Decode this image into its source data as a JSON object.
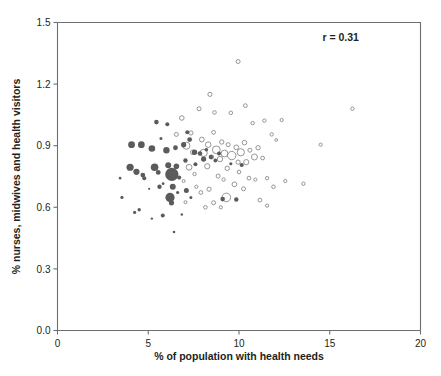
{
  "chart_data": {
    "type": "scatter",
    "title": "",
    "xlabel": "% of population with health needs",
    "ylabel": "% nurses, midwives and health visitors",
    "xlim": [
      0,
      20
    ],
    "ylim": [
      0.0,
      1.5
    ],
    "xticks": [
      "0",
      "5",
      "10",
      "15",
      "20"
    ],
    "xtick_values": [
      0,
      5,
      10,
      15,
      20
    ],
    "yticks": [
      "0.0",
      "0.3",
      "0.6",
      "0.9",
      "1.2",
      "1.5"
    ],
    "ytick_values": [
      0.0,
      0.3,
      0.6,
      0.9,
      1.2,
      1.5
    ],
    "grid": false,
    "legend": "none",
    "annotations": [
      {
        "name": "correlation",
        "text": "r = 0.31",
        "x": 15.6,
        "y": 1.41
      }
    ],
    "series": [
      {
        "name": "filled",
        "marker": "filled-circle",
        "color": "#5b5b5d",
        "points": [
          {
            "x": 3.55,
            "y": 0.648,
            "s": 1.6
          },
          {
            "x": 3.45,
            "y": 0.742,
            "s": 1.3
          },
          {
            "x": 4.25,
            "y": 0.575,
            "s": 1.6
          },
          {
            "x": 4.5,
            "y": 0.588,
            "s": 1.7
          },
          {
            "x": 4.08,
            "y": 0.905,
            "s": 3.4
          },
          {
            "x": 4.62,
            "y": 0.905,
            "s": 3.4
          },
          {
            "x": 4.0,
            "y": 0.795,
            "s": 3.6
          },
          {
            "x": 4.35,
            "y": 0.773,
            "s": 3.1
          },
          {
            "x": 4.7,
            "y": 0.757,
            "s": 2.4
          },
          {
            "x": 4.78,
            "y": 0.742,
            "s": 2.0
          },
          {
            "x": 5.2,
            "y": 0.886,
            "s": 3.3
          },
          {
            "x": 5.35,
            "y": 0.795,
            "s": 3.8
          },
          {
            "x": 5.55,
            "y": 0.77,
            "s": 2.4
          },
          {
            "x": 5.45,
            "y": 1.015,
            "s": 2.3
          },
          {
            "x": 5.7,
            "y": 0.935,
            "s": 1.5
          },
          {
            "x": 5.62,
            "y": 0.7,
            "s": 2.2
          },
          {
            "x": 5.82,
            "y": 0.715,
            "s": 1.4
          },
          {
            "x": 5.2,
            "y": 0.545,
            "s": 1.2
          },
          {
            "x": 5.8,
            "y": 0.56,
            "s": 2.0
          },
          {
            "x": 6.0,
            "y": 0.878,
            "s": 3.2
          },
          {
            "x": 6.1,
            "y": 0.805,
            "s": 3.0
          },
          {
            "x": 6.3,
            "y": 0.76,
            "s": 6.6
          },
          {
            "x": 6.35,
            "y": 0.7,
            "s": 3.0
          },
          {
            "x": 6.2,
            "y": 0.648,
            "s": 4.6
          },
          {
            "x": 6.28,
            "y": 0.622,
            "s": 2.6
          },
          {
            "x": 6.5,
            "y": 0.89,
            "s": 2.4
          },
          {
            "x": 6.55,
            "y": 0.8,
            "s": 2.8
          },
          {
            "x": 6.7,
            "y": 0.745,
            "s": 2.1
          },
          {
            "x": 6.62,
            "y": 0.672,
            "s": 1.6
          },
          {
            "x": 6.42,
            "y": 0.48,
            "s": 1.3
          },
          {
            "x": 6.95,
            "y": 0.905,
            "s": 2.6
          },
          {
            "x": 7.05,
            "y": 0.828,
            "s": 2.2
          },
          {
            "x": 7.15,
            "y": 0.965,
            "s": 2.0
          },
          {
            "x": 7.28,
            "y": 0.93,
            "s": 2.4
          },
          {
            "x": 7.1,
            "y": 0.682,
            "s": 2.5
          },
          {
            "x": 7.35,
            "y": 0.648,
            "s": 1.5
          },
          {
            "x": 7.55,
            "y": 0.868,
            "s": 2.7
          },
          {
            "x": 7.6,
            "y": 0.81,
            "s": 2.0
          },
          {
            "x": 7.85,
            "y": 0.862,
            "s": 2.3
          },
          {
            "x": 8.05,
            "y": 0.835,
            "s": 2.6
          },
          {
            "x": 8.2,
            "y": 0.88,
            "s": 1.8
          },
          {
            "x": 8.45,
            "y": 0.845,
            "s": 2.2
          },
          {
            "x": 8.7,
            "y": 0.828,
            "s": 1.9
          },
          {
            "x": 8.9,
            "y": 0.862,
            "s": 2.0
          },
          {
            "x": 9.1,
            "y": 0.64,
            "s": 2.3
          },
          {
            "x": 9.85,
            "y": 0.638,
            "s": 2.2
          },
          {
            "x": 9.55,
            "y": 0.812,
            "s": 1.6
          },
          {
            "x": 10.15,
            "y": 0.806,
            "s": 2.1
          },
          {
            "x": 6.85,
            "y": 0.565,
            "s": 1.2
          },
          {
            "x": 5.05,
            "y": 0.69,
            "s": 1.1
          },
          {
            "x": 6.05,
            "y": 1.005,
            "s": 2.0
          }
        ]
      },
      {
        "name": "open",
        "marker": "open-circle",
        "color": "#8a8a8d",
        "points": [
          {
            "x": 6.55,
            "y": 0.955,
            "s": 2.0
          },
          {
            "x": 6.85,
            "y": 1.035,
            "s": 2.3
          },
          {
            "x": 7.1,
            "y": 0.9,
            "s": 3.6
          },
          {
            "x": 7.35,
            "y": 0.962,
            "s": 2.1
          },
          {
            "x": 7.45,
            "y": 0.868,
            "s": 2.3
          },
          {
            "x": 7.25,
            "y": 0.795,
            "s": 2.9
          },
          {
            "x": 7.55,
            "y": 0.762,
            "s": 1.7
          },
          {
            "x": 7.8,
            "y": 1.08,
            "s": 2.0
          },
          {
            "x": 7.95,
            "y": 0.93,
            "s": 2.4
          },
          {
            "x": 8.05,
            "y": 0.865,
            "s": 3.7
          },
          {
            "x": 8.3,
            "y": 0.905,
            "s": 2.8
          },
          {
            "x": 8.25,
            "y": 0.8,
            "s": 2.6
          },
          {
            "x": 8.5,
            "y": 0.845,
            "s": 2.0
          },
          {
            "x": 8.6,
            "y": 0.965,
            "s": 1.9
          },
          {
            "x": 8.75,
            "y": 0.88,
            "s": 3.9
          },
          {
            "x": 8.95,
            "y": 0.835,
            "s": 2.7
          },
          {
            "x": 9.05,
            "y": 0.918,
            "s": 2.2
          },
          {
            "x": 9.2,
            "y": 0.862,
            "s": 3.4
          },
          {
            "x": 9.4,
            "y": 0.905,
            "s": 2.0
          },
          {
            "x": 9.35,
            "y": 0.79,
            "s": 2.2
          },
          {
            "x": 9.6,
            "y": 0.852,
            "s": 4.2
          },
          {
            "x": 9.85,
            "y": 0.892,
            "s": 2.4
          },
          {
            "x": 9.95,
            "y": 0.82,
            "s": 2.1
          },
          {
            "x": 10.1,
            "y": 0.868,
            "s": 3.6
          },
          {
            "x": 10.3,
            "y": 0.915,
            "s": 2.3
          },
          {
            "x": 10.4,
            "y": 0.82,
            "s": 2.6
          },
          {
            "x": 10.6,
            "y": 0.878,
            "s": 2.0
          },
          {
            "x": 10.85,
            "y": 0.845,
            "s": 3.0
          },
          {
            "x": 11.05,
            "y": 0.89,
            "s": 2.2
          },
          {
            "x": 11.3,
            "y": 0.84,
            "s": 1.9
          },
          {
            "x": 9.95,
            "y": 1.31,
            "s": 2.0
          },
          {
            "x": 8.4,
            "y": 1.15,
            "s": 2.1
          },
          {
            "x": 8.65,
            "y": 1.062,
            "s": 1.8
          },
          {
            "x": 9.55,
            "y": 1.06,
            "s": 1.8
          },
          {
            "x": 10.35,
            "y": 1.095,
            "s": 1.9
          },
          {
            "x": 10.75,
            "y": 1.01,
            "s": 1.7
          },
          {
            "x": 11.4,
            "y": 1.022,
            "s": 1.7
          },
          {
            "x": 12.35,
            "y": 1.025,
            "s": 1.6
          },
          {
            "x": 16.25,
            "y": 1.08,
            "s": 1.7
          },
          {
            "x": 11.8,
            "y": 0.955,
            "s": 1.7
          },
          {
            "x": 12.05,
            "y": 0.928,
            "s": 1.4
          },
          {
            "x": 14.5,
            "y": 0.905,
            "s": 1.6
          },
          {
            "x": 11.55,
            "y": 0.742,
            "s": 1.7
          },
          {
            "x": 11.9,
            "y": 0.7,
            "s": 1.8
          },
          {
            "x": 12.55,
            "y": 0.728,
            "s": 1.6
          },
          {
            "x": 13.55,
            "y": 0.715,
            "s": 1.7
          },
          {
            "x": 10.55,
            "y": 0.742,
            "s": 1.9
          },
          {
            "x": 10.25,
            "y": 0.69,
            "s": 2.0
          },
          {
            "x": 9.75,
            "y": 0.712,
            "s": 2.4
          },
          {
            "x": 9.3,
            "y": 0.648,
            "s": 4.3
          },
          {
            "x": 9.0,
            "y": 0.6,
            "s": 1.6
          },
          {
            "x": 8.6,
            "y": 0.622,
            "s": 2.0
          },
          {
            "x": 8.15,
            "y": 0.6,
            "s": 1.8
          },
          {
            "x": 8.35,
            "y": 0.688,
            "s": 2.1
          },
          {
            "x": 7.9,
            "y": 0.672,
            "s": 1.9
          },
          {
            "x": 7.65,
            "y": 0.7,
            "s": 1.6
          },
          {
            "x": 7.05,
            "y": 0.625,
            "s": 1.5
          },
          {
            "x": 10.9,
            "y": 0.735,
            "s": 1.6
          },
          {
            "x": 8.85,
            "y": 0.752,
            "s": 2.0
          },
          {
            "x": 9.15,
            "y": 0.735,
            "s": 1.7
          },
          {
            "x": 10.0,
            "y": 0.772,
            "s": 1.8
          },
          {
            "x": 6.95,
            "y": 0.728,
            "s": 1.5
          },
          {
            "x": 11.15,
            "y": 0.635,
            "s": 1.9
          },
          {
            "x": 11.55,
            "y": 0.608,
            "s": 1.6
          }
        ]
      }
    ]
  }
}
